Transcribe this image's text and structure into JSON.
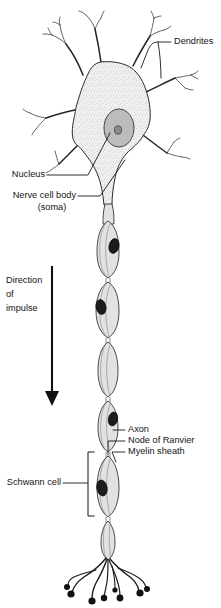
{
  "figure": {
    "background_color": "#ffffff",
    "line_color": "#1e1e1e",
    "soma_fill_color": "#ededed",
    "myelin_fill_color": "#e2e2e2",
    "schwann_nucleus_color": "#1c1c1c"
  },
  "labels": {
    "dendrites": "Dendrites",
    "nucleus": "Nucleus",
    "nerve_cell_body": "Nerve cell body",
    "soma": "(soma)",
    "direction_line1": "Direction",
    "direction_line2": "of",
    "direction_line3": "impulse",
    "axon": "Axon",
    "node_of_ranvier": "Node of Ranvier",
    "myelin_sheath": "Myelin sheath",
    "schwann_cell": "Schwann cell"
  },
  "parts": [
    {
      "name": "dendrites",
      "label": "Dendrites"
    },
    {
      "name": "nucleus",
      "label": "Nucleus"
    },
    {
      "name": "soma",
      "label": "Nerve cell body (soma)"
    },
    {
      "name": "axon",
      "label": "Axon"
    },
    {
      "name": "node-of-ranvier",
      "label": "Node of Ranvier"
    },
    {
      "name": "myelin-sheath",
      "label": "Myelin sheath"
    },
    {
      "name": "schwann-cell",
      "label": "Schwann cell"
    },
    {
      "name": "direction-of-impulse",
      "label": "Direction of impulse"
    }
  ]
}
